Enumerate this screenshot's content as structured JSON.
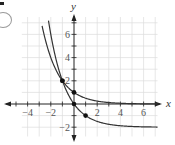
{
  "chart_data": {
    "type": "line",
    "title": "",
    "xlabel": "x",
    "ylabel": "y",
    "xlim": [
      -5.8,
      7.8
    ],
    "ylim": [
      -3.5,
      8.8
    ],
    "grid": true,
    "x_ticks": [
      -4,
      -3,
      -2,
      -1,
      1,
      2,
      3,
      4,
      5,
      6
    ],
    "x_tick_labels": [
      "−4",
      "−2",
      "2",
      "4",
      "6"
    ],
    "x_tick_label_values": [
      -4,
      -2,
      2,
      4,
      6
    ],
    "y_tick_labels": [
      "6",
      "4",
      "2",
      "−2"
    ],
    "y_tick_label_values": [
      6,
      4,
      2,
      -2
    ],
    "series": [
      {
        "name": "y = (1/2)^x",
        "points": [
          [
            -2.7,
            6.5
          ],
          [
            -2,
            4
          ],
          [
            -1,
            2
          ],
          [
            0,
            1
          ],
          [
            1,
            0.5
          ],
          [
            2,
            0.25
          ],
          [
            3,
            0.125
          ],
          [
            4,
            0.0625
          ],
          [
            5,
            0.03
          ],
          [
            6,
            0.016
          ]
        ],
        "marked_points": [
          [
            -1,
            2
          ],
          [
            0,
            1
          ]
        ],
        "asymptote": 0
      },
      {
        "name": "y = (1/2)^(x-1) - 2",
        "points": [
          [
            -2.1,
            6.6
          ],
          [
            -2,
            6
          ],
          [
            -1,
            2
          ],
          [
            0,
            0
          ],
          [
            1,
            -1
          ],
          [
            2,
            -1.5
          ],
          [
            3,
            -1.75
          ],
          [
            4,
            -1.875
          ],
          [
            5,
            -1.94
          ],
          [
            6,
            -1.97
          ],
          [
            7,
            -1.98
          ]
        ],
        "marked_points": [
          [
            -1,
            2
          ],
          [
            0,
            0
          ],
          [
            1,
            -1
          ]
        ],
        "asymptote": -2
      }
    ],
    "legend": "none"
  },
  "labels": {
    "x_axis": "x",
    "y_axis": "y"
  }
}
